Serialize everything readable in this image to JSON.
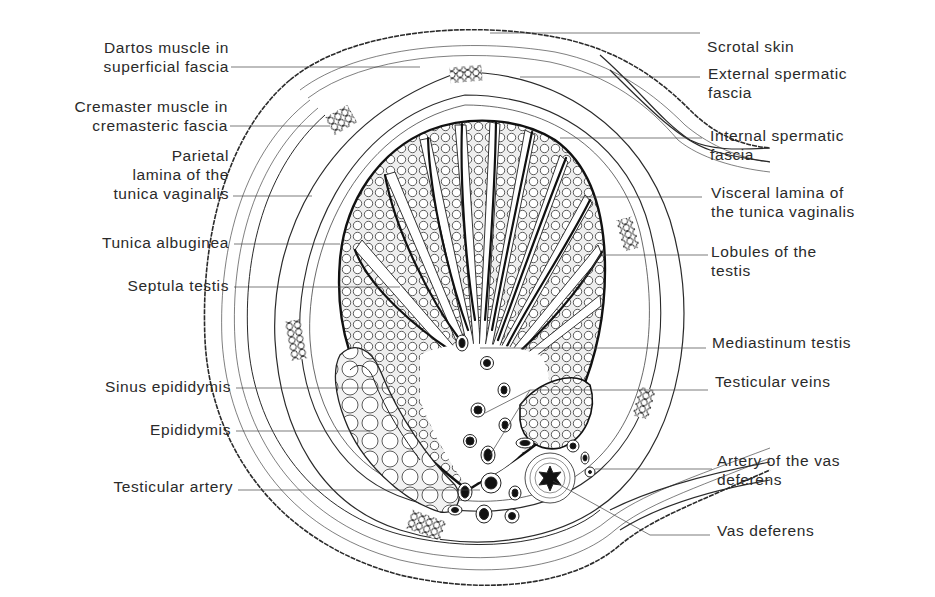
{
  "figure": {
    "labels_left": [
      {
        "id": "dartos",
        "lines": [
          "Dartos muscle in",
          "superficial fascia"
        ]
      },
      {
        "id": "cremaster",
        "lines": [
          "Cremaster muscle in",
          "cremasteric fascia"
        ]
      },
      {
        "id": "parietal",
        "lines": [
          "Parietal",
          "lamina of the",
          "tunica vaginalis"
        ]
      },
      {
        "id": "albuginea",
        "lines": [
          "Tunica albuginea"
        ]
      },
      {
        "id": "septula",
        "lines": [
          "Septula testis"
        ]
      },
      {
        "id": "sinus",
        "lines": [
          "Sinus epididymis"
        ]
      },
      {
        "id": "epididymis",
        "lines": [
          "Epididymis"
        ]
      },
      {
        "id": "testicular-artery",
        "lines": [
          "Testicular artery"
        ]
      }
    ],
    "labels_right": [
      {
        "id": "scrotal-skin",
        "lines": [
          "Scrotal skin"
        ]
      },
      {
        "id": "external-spermatic",
        "lines": [
          "External spermatic",
          "fascia"
        ]
      },
      {
        "id": "internal-spermatic",
        "lines": [
          "Internal spermatic",
          "fascia"
        ]
      },
      {
        "id": "visceral",
        "lines": [
          "Visceral lamina of",
          "the tunica vaginalis"
        ]
      },
      {
        "id": "lobules",
        "lines": [
          "Lobules of the",
          "testis"
        ]
      },
      {
        "id": "mediastinum",
        "lines": [
          "Mediastinum testis"
        ]
      },
      {
        "id": "testicular-veins",
        "lines": [
          "Testicular veins"
        ]
      },
      {
        "id": "artery-vas",
        "lines": [
          "Artery of the vas",
          "deferens"
        ]
      },
      {
        "id": "vas-deferens",
        "lines": [
          "Vas deferens"
        ]
      }
    ]
  },
  "colors": {
    "ink": "#2a2a2a",
    "background": "#ffffff",
    "stipple": "#d8d8d8"
  }
}
